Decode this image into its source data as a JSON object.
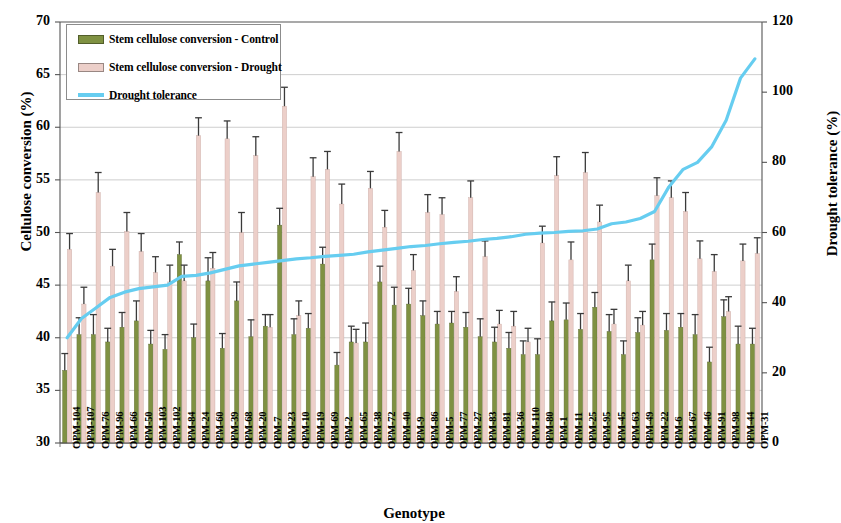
{
  "chart_data": {
    "type": "bar",
    "title": "",
    "xlabel": "Genotype",
    "ylabel": "Cellulose conversion (%)",
    "ylabel_secondary": "Drought tolerance (%)",
    "ylim": [
      30,
      70
    ],
    "yticks": [
      30,
      35,
      40,
      45,
      50,
      55,
      60,
      65,
      70
    ],
    "ylim_secondary": [
      0,
      120
    ],
    "yticks_secondary": [
      0,
      20,
      40,
      60,
      80,
      100,
      120
    ],
    "grid": true,
    "legend_position": "top-left",
    "colors": {
      "control": "#7f9142",
      "drought": "#eccfc9",
      "tolerance_line": "#66cdf0",
      "error_bar": "#3a3a3a",
      "grid": "#b9b9b9",
      "axis": "#555555"
    },
    "categories": [
      "OPM-104",
      "OPM-107",
      "OPM-76",
      "OPM-96",
      "OPM-66",
      "OPM-50",
      "OPM-103",
      "OPM-102",
      "OPM-84",
      "OPM-24",
      "OPM-60",
      "OPM-39",
      "OPM-68",
      "OPM-20",
      "OPM-7",
      "OPM-23",
      "OPM-10",
      "OPM-19",
      "OPM-69",
      "OPM-2",
      "OPM-65",
      "OPM-38",
      "OPM-72",
      "OPM-40",
      "OPM-9",
      "OPM-86",
      "OPM-5",
      "OPM-77",
      "OPM-27",
      "OPM-83",
      "OPM-81",
      "OPM-36",
      "OPM-110",
      "OPM-80",
      "OPM-1",
      "OPM-11",
      "OPM-25",
      "OPM-95",
      "OPM-45",
      "OPM-63",
      "OPM-49",
      "OPM-22",
      "OPM-6",
      "OPM-67",
      "OPM-46",
      "OPM-91",
      "OPM-98",
      "OPM-44",
      "OPM-31"
    ],
    "series": [
      {
        "name": "Stem cellulose conversion - Control",
        "key": "control",
        "values": [
          36.9,
          40.3,
          40.3,
          39.6,
          41.0,
          41.6,
          39.4,
          38.9,
          47.9,
          40.0,
          45.4,
          39.0,
          43.5,
          40.1,
          41.1,
          50.7,
          40.3,
          40.9,
          47.0,
          37.4,
          39.6,
          39.6,
          45.3,
          43.1,
          43.2,
          42.1,
          41.3,
          41.4,
          41.0,
          40.1,
          39.6,
          39.0,
          38.4,
          38.4,
          41.6,
          41.7,
          40.8,
          42.9,
          40.6,
          38.4,
          40.5,
          47.4,
          40.7,
          41.0,
          40.3,
          37.7,
          42.0,
          39.4,
          39.4
        ],
        "errors": [
          1.6,
          1.6,
          1.9,
          1.3,
          1.4,
          1.9,
          1.3,
          1.4,
          1.2,
          1.3,
          2.2,
          1.4,
          1.8,
          1.6,
          1.1,
          1.6,
          1.5,
          1.4,
          1.6,
          1.2,
          1.5,
          1.8,
          1.5,
          1.7,
          1.5,
          1.4,
          1.2,
          1.1,
          1.4,
          1.7,
          1.4,
          1.5,
          1.3,
          1.5,
          1.8,
          1.6,
          1.5,
          1.4,
          1.6,
          1.3,
          1.4,
          1.5,
          1.6,
          1.3,
          1.9,
          1.4,
          1.6,
          1.7,
          1.5
        ]
      },
      {
        "name": "Stem cellulose conversion - Drought",
        "key": "drought",
        "values": [
          48.4,
          43.2,
          53.8,
          46.8,
          50.1,
          48.2,
          46.2,
          45.3,
          45.4,
          59.2,
          46.6,
          58.9,
          50.0,
          57.3,
          41.0,
          62.0,
          42.1,
          55.3,
          56.0,
          52.7,
          39.5,
          54.2,
          50.5,
          57.7,
          46.4,
          51.9,
          51.7,
          44.4,
          53.3,
          47.7,
          41.3,
          41.1,
          39.6,
          49.0,
          55.4,
          47.4,
          55.7,
          51.0,
          41.3,
          45.4,
          41.2,
          53.5,
          53.3,
          52.0,
          47.5,
          46.3,
          42.5,
          47.3,
          48.0
        ],
        "errors": [
          1.5,
          1.6,
          1.9,
          1.6,
          1.8,
          1.7,
          1.5,
          1.6,
          1.5,
          1.7,
          1.5,
          1.7,
          1.9,
          1.8,
          1.2,
          1.8,
          1.4,
          1.8,
          1.7,
          1.9,
          1.3,
          1.6,
          1.6,
          1.8,
          1.5,
          1.7,
          1.6,
          1.4,
          1.6,
          1.5,
          1.3,
          1.4,
          1.3,
          1.6,
          1.8,
          1.7,
          1.9,
          1.6,
          1.4,
          1.5,
          1.3,
          1.7,
          1.6,
          1.8,
          1.7,
          1.6,
          1.4,
          1.6,
          1.5
        ]
      }
    ],
    "line_series": {
      "name": "Drought tolerance",
      "key": "tolerance",
      "axis": "secondary",
      "values": [
        30.0,
        35.5,
        38.5,
        41.5,
        43.0,
        44.0,
        44.5,
        45.0,
        47.5,
        47.8,
        48.5,
        49.5,
        50.5,
        51.0,
        51.5,
        52.0,
        52.5,
        52.8,
        53.2,
        53.5,
        53.8,
        54.5,
        55.0,
        55.5,
        56.0,
        56.3,
        56.8,
        57.2,
        57.5,
        58.0,
        58.3,
        58.8,
        59.5,
        59.8,
        60.0,
        60.3,
        60.5,
        61.0,
        62.5,
        63.0,
        64.0,
        66.0,
        73.0,
        78.0,
        80.0,
        84.5,
        92.0,
        104.0,
        109.5
      ]
    }
  },
  "legend": {
    "items": [
      {
        "label": "Stem cellulose conversion - Control",
        "type": "swatch",
        "color": "#7f9142"
      },
      {
        "label": "Stem cellulose conversion - Drought",
        "type": "swatch",
        "color": "#eccfc9"
      },
      {
        "label": "Drought tolerance",
        "type": "line",
        "color": "#66cdf0"
      }
    ]
  }
}
